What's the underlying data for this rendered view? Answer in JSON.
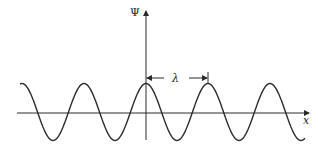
{
  "diagram": {
    "title": "",
    "y_axis_label": "Ψ",
    "x_axis_label": "x",
    "wavelength_label": "λ",
    "colors": {
      "line": "#2a2a2a",
      "background": "#ffffff"
    }
  },
  "chart_data": {
    "type": "line",
    "title": "",
    "xlabel": "x",
    "ylabel": "Ψ",
    "function": "cosine wave Ψ = A cos(2πx/λ)",
    "annotations": [
      "λ marks one wavelength from the peak at the origin to the next peak"
    ],
    "grid": false,
    "cycles_visible": 4.6
  }
}
